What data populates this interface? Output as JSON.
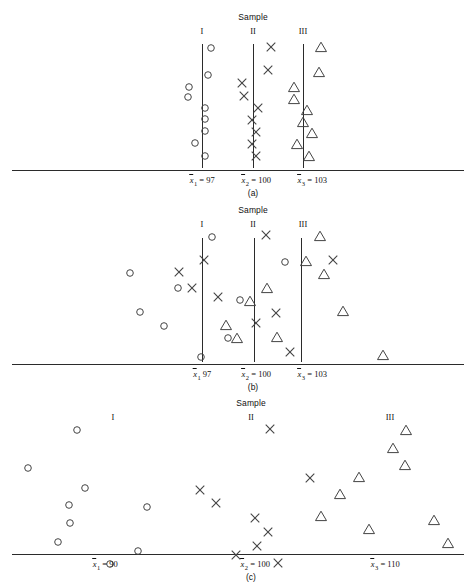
{
  "figure": {
    "sample_title": "Sample",
    "column_headers": [
      "I",
      "II",
      "III"
    ],
    "marker_legend": {
      "sample_1": "circle",
      "sample_2": "x-cross",
      "sample_3": "triangle"
    },
    "line_color": "#2b2b2b",
    "marker_color": "#444444",
    "background": "#ffffff"
  },
  "chart_data": {
    "type": "scatter",
    "title": "Sample",
    "xlabel": "",
    "ylabel": "",
    "panels": [
      {
        "caption": "(a)",
        "sample_title": "Sample",
        "headers": [
          {
            "label": "I",
            "x": 202
          },
          {
            "label": "II",
            "x": 253
          },
          {
            "label": "III",
            "x": 303
          }
        ],
        "mean_labels": [
          {
            "text": "x̄1 = 97",
            "symbol": "x",
            "sub": "1",
            "eq": "=",
            "value": "97",
            "x": 202
          },
          {
            "text": "x̄2 = 100",
            "symbol": "x",
            "sub": "2",
            "eq": "=",
            "value": "100",
            "x": 256
          },
          {
            "text": "x̄3 = 103",
            "symbol": "x",
            "sub": "3",
            "eq": "=",
            "value": "103",
            "x": 312
          }
        ],
        "vlines": [
          {
            "x": 202,
            "y_top": 44,
            "y_bottom": 168
          },
          {
            "x": 253,
            "y_top": 44,
            "y_bottom": 168
          },
          {
            "x": 303,
            "y_top": 44,
            "y_bottom": 168
          }
        ],
        "axis": {
          "x1": 12,
          "x2": 464,
          "y": 170
        },
        "series": [
          {
            "name": "Sample I",
            "marker": "circle",
            "points": [
              [
                211,
                48
              ],
              [
                208,
                75
              ],
              [
                189,
                87
              ],
              [
                188,
                97
              ],
              [
                205,
                108
              ],
              [
                205,
                119
              ],
              [
                205,
                131
              ],
              [
                195,
                143
              ],
              [
                205,
                156
              ]
            ]
          },
          {
            "name": "Sample II",
            "marker": "x-cross",
            "points": [
              [
                271,
                47
              ],
              [
                268,
                70
              ],
              [
                242,
                83
              ],
              [
                244,
                96
              ],
              [
                258,
                108
              ],
              [
                252,
                120
              ],
              [
                256,
                132
              ],
              [
                252,
                144
              ],
              [
                256,
                156
              ]
            ]
          },
          {
            "name": "Sample III",
            "marker": "triangle",
            "points": [
              [
                321,
                47
              ],
              [
                319,
                72
              ],
              [
                294,
                87
              ],
              [
                294,
                99
              ],
              [
                307,
                110
              ],
              [
                303,
                122
              ],
              [
                312,
                133
              ],
              [
                297,
                144
              ],
              [
                309,
                156
              ]
            ]
          }
        ]
      },
      {
        "caption": "(b)",
        "sample_title": "Sample",
        "headers": [
          {
            "label": "I",
            "x": 202
          },
          {
            "label": "II",
            "x": 253
          },
          {
            "label": "III",
            "x": 303
          }
        ],
        "mean_labels": [
          {
            "text": "x̄1 97",
            "symbol": "x",
            "sub": "1",
            "eq": "",
            "value": "97",
            "x": 202
          },
          {
            "text": "x̄2 = 100",
            "symbol": "x",
            "sub": "2",
            "eq": "=",
            "value": "100",
            "x": 256
          },
          {
            "text": "x̄3 = 103",
            "symbol": "x",
            "sub": "3",
            "eq": "=",
            "value": "103",
            "x": 312
          }
        ],
        "vlines": [
          {
            "x": 202,
            "y_top": 238,
            "y_bottom": 362
          },
          {
            "x": 254,
            "y_top": 238,
            "y_bottom": 362
          },
          {
            "x": 301,
            "y_top": 238,
            "y_bottom": 362
          }
        ],
        "axis": {
          "x1": 12,
          "x2": 464,
          "y": 364
        },
        "series": [
          {
            "name": "Sample I",
            "marker": "circle",
            "points": [
              [
                212,
                237
              ],
              [
                130,
                273
              ],
              [
                178,
                288
              ],
              [
                140,
                312
              ],
              [
                164,
                326
              ],
              [
                240,
                300
              ],
              [
                228,
                338
              ],
              [
                285,
                262
              ],
              [
                201,
                357
              ]
            ]
          },
          {
            "name": "Sample II",
            "marker": "x-cross",
            "points": [
              [
                266,
                235
              ],
              [
                179,
                272
              ],
              [
                192,
                288
              ],
              [
                218,
                297
              ],
              [
                276,
                313
              ],
              [
                256,
                323
              ],
              [
                333,
                260
              ],
              [
                290,
                352
              ],
              [
                204,
                260
              ]
            ]
          },
          {
            "name": "Sample III",
            "marker": "triangle",
            "points": [
              [
                320,
                236
              ],
              [
                306,
                261
              ],
              [
                324,
                274
              ],
              [
                267,
                288
              ],
              [
                250,
                301
              ],
              [
                226,
                325
              ],
              [
                237,
                338
              ],
              [
                277,
                337
              ],
              [
                343,
                311
              ],
              [
                383,
                355
              ]
            ]
          }
        ]
      },
      {
        "caption": "(c)",
        "sample_title": "Sample",
        "headers": [
          {
            "label": "I",
            "x": 113
          },
          {
            "label": "II",
            "x": 251
          },
          {
            "label": "III",
            "x": 390
          }
        ],
        "mean_labels": [
          {
            "text": "x̄1 = 90",
            "symbol": "x",
            "sub": "1",
            "eq": "=",
            "value": "90",
            "x": 105
          },
          {
            "text": "x̄2 = 100",
            "symbol": "x",
            "sub": "2",
            "eq": "=",
            "value": "100",
            "x": 255
          },
          {
            "text": "x̄3 = 110",
            "symbol": "x",
            "sub": "3",
            "eq": "=",
            "value": "110",
            "x": 385
          }
        ],
        "vlines": [],
        "axis": {
          "x1": 12,
          "x2": 464,
          "y": 554
        },
        "series": [
          {
            "name": "Sample I",
            "marker": "circle",
            "points": [
              [
                77,
                430
              ],
              [
                28,
                468
              ],
              [
                69,
                505
              ],
              [
                85,
                488
              ],
              [
                147,
                507
              ],
              [
                70,
                523
              ],
              [
                58,
                542
              ],
              [
                110,
                564
              ],
              [
                138,
                551
              ]
            ]
          },
          {
            "name": "Sample II",
            "marker": "x-cross",
            "points": [
              [
                270,
                429
              ],
              [
                200,
                490
              ],
              [
                216,
                503
              ],
              [
                255,
                518
              ],
              [
                268,
                532
              ],
              [
                257,
                546
              ],
              [
                236,
                555
              ],
              [
                278,
                563
              ],
              [
                310,
                478
              ]
            ]
          },
          {
            "name": "Sample III",
            "marker": "triangle",
            "points": [
              [
                406,
                430
              ],
              [
                393,
                448
              ],
              [
                405,
                465
              ],
              [
                359,
                477
              ],
              [
                340,
                494
              ],
              [
                321,
                516
              ],
              [
                369,
                529
              ],
              [
                434,
                520
              ],
              [
                448,
                543
              ]
            ]
          }
        ]
      }
    ]
  }
}
